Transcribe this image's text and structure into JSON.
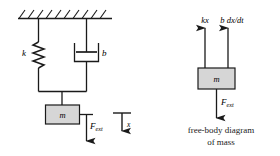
{
  "figure": {
    "background_color": "#ffffff",
    "line_color": "#1a1a1a",
    "block_fill_color": "#d6d6d6"
  },
  "left_diagram": {
    "name": "mass-spring-damper-schematic",
    "ground": {
      "label": "fixed-support-hatching",
      "hatch_count": 10
    },
    "spring": {
      "label": "k",
      "element": "spring"
    },
    "damper": {
      "label": "b",
      "element": "damper"
    },
    "mass": {
      "label": "m",
      "element": "mass-block"
    },
    "applied_force": {
      "label": "F",
      "subscript": "ext",
      "direction": "down"
    },
    "displacement": {
      "label": "x",
      "direction": "down"
    }
  },
  "right_diagram": {
    "name": "free-body-diagram",
    "mass": {
      "label": "m",
      "element": "mass-block"
    },
    "spring_force": {
      "label": "kx",
      "direction": "up"
    },
    "damper_force": {
      "label": "b dx/dt",
      "direction": "up"
    },
    "applied_force": {
      "label": "F",
      "subscript": "ext",
      "direction": "down"
    },
    "caption": {
      "line1": "free-body diagram",
      "line2": "of mass"
    }
  }
}
